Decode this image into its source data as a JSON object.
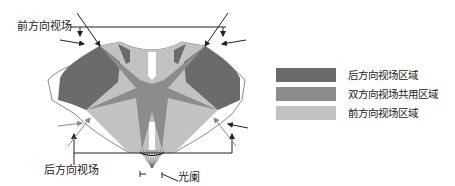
{
  "labels": {
    "front_view": "前方向视场",
    "rear_view": "后方向视场",
    "aperture": "光阑"
  },
  "legend": {
    "items": [
      {
        "label": "后方向视场区域",
        "color": "#6b6b6b"
      },
      {
        "label": "双方向视场共用区域",
        "color": "#8c8c8c"
      },
      {
        "label": "前方向视场区域",
        "color": "#c2c2c2"
      }
    ]
  },
  "colors": {
    "rear_region": "#6b6b6b",
    "shared_region": "#8c8c8c",
    "front_region": "#c2c2c2",
    "outline": "#888888",
    "arrow": "#222222",
    "gray_arrow": "#8a8a8a"
  }
}
